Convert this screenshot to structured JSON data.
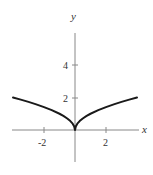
{
  "chart_data": {
    "type": "line",
    "title": "",
    "xlabel": "x",
    "ylabel": "y",
    "function": "y = sqrt(|x|)",
    "xlim": [
      -4.1,
      4.4
    ],
    "ylim": [
      -2,
      6
    ],
    "x_ticks": [
      -2,
      2
    ],
    "y_ticks": [
      2,
      4
    ],
    "x_tick_labels": [
      "-2",
      "2"
    ],
    "y_tick_labels": [
      "2",
      "4"
    ],
    "grid": false,
    "legend": null,
    "series": [
      {
        "name": "curve",
        "color": "#1a1a1a",
        "x": [
          -4,
          -3.5,
          -3,
          -2.5,
          -2,
          -1.5,
          -1,
          -0.75,
          -0.5,
          -0.3,
          -0.15,
          -0.05,
          0,
          0.05,
          0.15,
          0.3,
          0.5,
          0.75,
          1,
          1.5,
          2,
          2.5,
          3,
          3.5,
          4
        ],
        "y": [
          2.0,
          1.87,
          1.73,
          1.58,
          1.41,
          1.22,
          1.0,
          0.87,
          0.71,
          0.55,
          0.39,
          0.22,
          0.0,
          0.22,
          0.39,
          0.55,
          0.71,
          0.87,
          1.0,
          1.22,
          1.41,
          1.58,
          1.73,
          1.87,
          2.0
        ]
      }
    ]
  },
  "layout": {
    "origin_px": [
      75,
      130
    ],
    "x_scale_px": 15.5,
    "y_scale_px": 16.25
  }
}
